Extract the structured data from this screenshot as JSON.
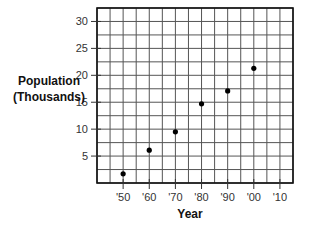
{
  "chart_data": {
    "type": "scatter",
    "title": "",
    "xlabel": "Year",
    "ylabel": "Population (Thousands)",
    "ylabel_lines": [
      "Population",
      "(Thousands)"
    ],
    "x_tick_labels": [
      "'50",
      "'60",
      "'70",
      "'80",
      "'90",
      "'00",
      "'10"
    ],
    "x_ticks": [
      1950,
      1960,
      1970,
      1980,
      1990,
      2000,
      2010
    ],
    "y_tick_labels": [
      "5",
      "10",
      "15",
      "20",
      "25",
      "30"
    ],
    "y_ticks": [
      5,
      10,
      15,
      20,
      25,
      30
    ],
    "xlim": [
      1940,
      2015
    ],
    "ylim": [
      0,
      32.5
    ],
    "grid": true,
    "legend": null,
    "x": [
      1950,
      1960,
      1970,
      1980,
      1990,
      2000
    ],
    "values": [
      1.7,
      6.1,
      9.5,
      14.7,
      17.1,
      21.3
    ],
    "marker_color": "#000000",
    "grid_color": "#555555"
  }
}
